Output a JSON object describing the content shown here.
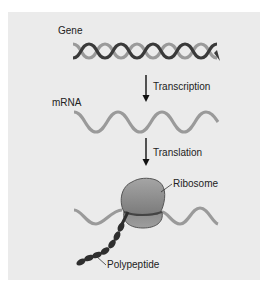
{
  "figure": {
    "labels": {
      "gene": "Gene",
      "transcription": "Transcription",
      "mrna": "mRNA",
      "translation": "Translation",
      "ribosome": "Ribosome",
      "polypeptide": "Polypeptide"
    },
    "colors": {
      "panel_background": "#ebebeb",
      "dna_strand_dark": "#3a3a3a",
      "dna_strand_light": "#9a9a9a",
      "mrna_strand": "#9a9a9a",
      "ribosome_fill": "#8a8a8a",
      "polypeptide": "#2e2e2e",
      "arrow": "#111111"
    },
    "stages": [
      "Gene",
      "mRNA",
      "Ribosome + Polypeptide"
    ],
    "processes": [
      "Transcription",
      "Translation"
    ]
  }
}
